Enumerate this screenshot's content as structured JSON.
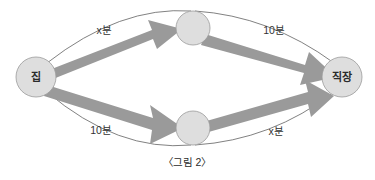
{
  "figure": {
    "caption": "〈그림 2〉",
    "background_color": "#ffffff",
    "node_fill_color": "#dedede",
    "node_stroke_color": "#9b9b9b",
    "arrow_color": "#9a9a9a",
    "arc_color": "#4a4a4a",
    "text_color": "#2b2b2b"
  },
  "nodes": [
    {
      "id": "home",
      "label": "집",
      "position": "left",
      "cx": 36,
      "cy": 77,
      "r": 20
    },
    {
      "id": "via-top",
      "label": "",
      "position": "top-middle",
      "cx": 193,
      "cy": 28,
      "r": 17
    },
    {
      "id": "via-bottom",
      "label": "",
      "position": "bottom-middle",
      "cx": 193,
      "cy": 128,
      "r": 17
    },
    {
      "id": "work",
      "label": "직장",
      "position": "right",
      "cx": 342,
      "cy": 77,
      "r": 20
    }
  ],
  "edges": [
    {
      "id": "home-to-top",
      "from": "집",
      "to": "",
      "label": "x분",
      "label_x": 104,
      "label_y": 30
    },
    {
      "id": "top-to-work",
      "from": "",
      "to": "직장",
      "label": "10분",
      "label_x": 274,
      "label_y": 30
    },
    {
      "id": "home-to-bottom",
      "from": "집",
      "to": "",
      "label": "10분",
      "label_x": 101,
      "label_y": 130
    },
    {
      "id": "bottom-to-work",
      "from": "",
      "to": "직장",
      "label": "x분",
      "label_x": 276,
      "label_y": 131
    }
  ]
}
